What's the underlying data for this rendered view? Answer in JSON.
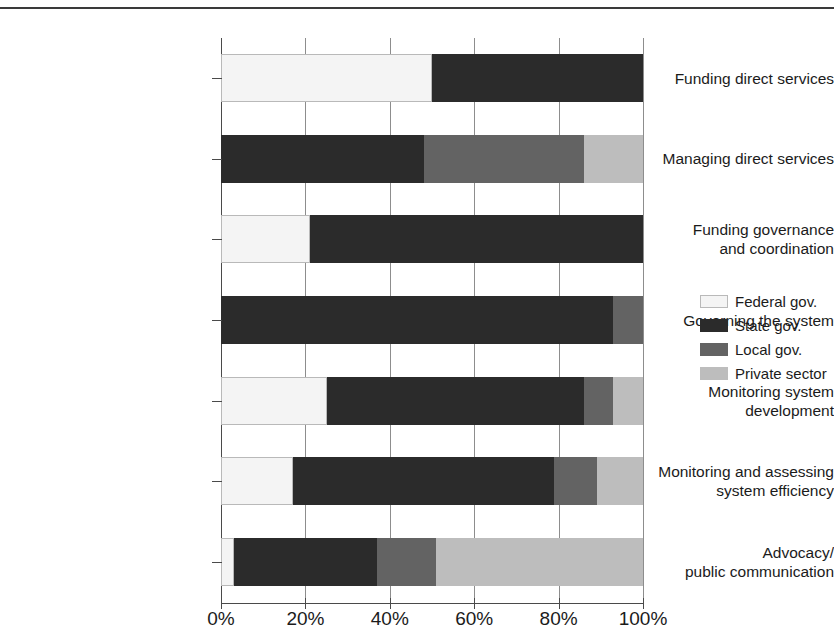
{
  "title_remnant": "",
  "chart_data": {
    "type": "bar",
    "orientation": "horizontal",
    "stacked": true,
    "title": "",
    "xlabel": "",
    "ylabel": "",
    "xlim": [
      0,
      100
    ],
    "grid": true,
    "legend_position": "right",
    "xticks": [
      "0%",
      "20%",
      "40%",
      "60%",
      "80%",
      "100%"
    ],
    "xtick_values": [
      0,
      20,
      40,
      60,
      80,
      100
    ],
    "categories": [
      "Funding direct services",
      "Managing direct services",
      "Funding governance\nand coordination",
      "Governing the system",
      "Monitoring system\ndevelopment",
      "Monitoring and assessing\nsystem efficiency",
      "Advocacy/\npublic communication"
    ],
    "series": [
      {
        "name": "Federal gov.",
        "color": "#f4f4f4",
        "values": [
          50,
          0,
          21,
          0,
          25,
          17,
          3
        ]
      },
      {
        "name": "State gov.",
        "color": "#2b2b2b",
        "values": [
          50,
          48,
          79,
          93,
          61,
          62,
          34
        ]
      },
      {
        "name": "Local gov.",
        "color": "#636363",
        "values": [
          0,
          38,
          0,
          7,
          7,
          10,
          14
        ]
      },
      {
        "name": "Private sector",
        "color": "#bdbdbd",
        "values": [
          0,
          14,
          0,
          0,
          7,
          11,
          49
        ]
      }
    ]
  },
  "legend": {
    "items": [
      {
        "label": "Federal gov.",
        "color": "#f4f4f4"
      },
      {
        "label": "State gov.",
        "color": "#2b2b2b"
      },
      {
        "label": "Local gov.",
        "color": "#636363"
      },
      {
        "label": "Private sector",
        "color": "#bdbdbd"
      }
    ]
  }
}
